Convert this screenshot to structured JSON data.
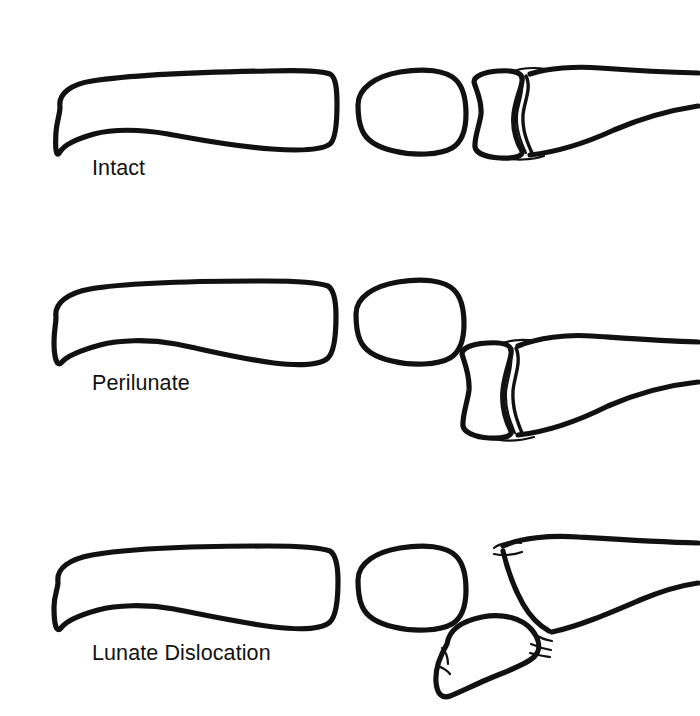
{
  "figure": {
    "type": "medical-line-diagram",
    "background_color": "#ffffff",
    "line_color": "#111111",
    "panel_count": 3
  },
  "panels": [
    {
      "id": "intact",
      "label": "Intact",
      "label_x": 92,
      "label_y": 175,
      "bones": [
        {
          "name": "metacarpal",
          "position": "left",
          "state": "aligned"
        },
        {
          "name": "capitate",
          "position": "middle",
          "state": "aligned"
        },
        {
          "name": "lunate",
          "position": "right-inner",
          "state": "seated-in-radius"
        },
        {
          "name": "radius",
          "position": "right",
          "state": "aligned"
        }
      ]
    },
    {
      "id": "perilunate",
      "label": "Perilunate",
      "label_x": 92,
      "label_y": 390,
      "bones": [
        {
          "name": "metacarpal",
          "position": "left",
          "state": "displaced-dorsal"
        },
        {
          "name": "capitate",
          "position": "middle",
          "state": "displaced-dorsal"
        },
        {
          "name": "lunate",
          "position": "right-inner",
          "state": "seated-in-radius"
        },
        {
          "name": "radius",
          "position": "right",
          "state": "aligned"
        }
      ]
    },
    {
      "id": "lunate-dislocation",
      "label": "Lunate Dislocation",
      "label_x": 92,
      "label_y": 660,
      "bones": [
        {
          "name": "metacarpal",
          "position": "left",
          "state": "aligned"
        },
        {
          "name": "capitate",
          "position": "middle",
          "state": "aligned"
        },
        {
          "name": "lunate",
          "position": "below-radius",
          "state": "dislocated-volar-rotated"
        },
        {
          "name": "radius",
          "position": "right",
          "state": "empty-articular-surface"
        }
      ]
    }
  ]
}
